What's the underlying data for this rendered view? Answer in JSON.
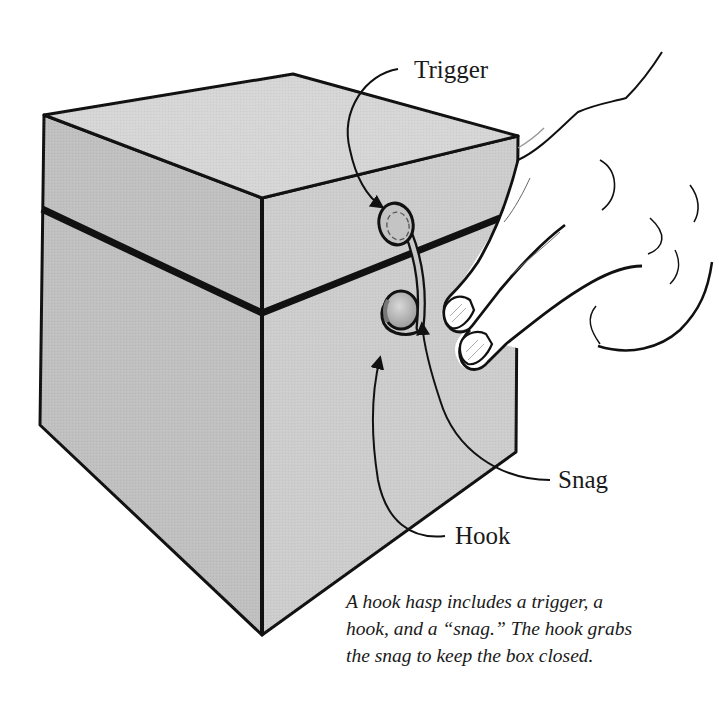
{
  "figure": {
    "colors": {
      "background": "#ffffff",
      "box_top": "#d4d4d4",
      "box_left": "#c0c0c0",
      "box_right": "#cdcdcd",
      "outline": "#111111",
      "hardware": "#b8b8b8",
      "hand": "#ffffff"
    }
  },
  "labels": {
    "trigger": "Trigger",
    "snag": "Snag",
    "hook": "Hook"
  },
  "caption": {
    "lines": [
      "A hook hasp includes a trigger, a",
      "hook, and a “snag.” The hook grabs",
      "the snag to keep the box closed."
    ]
  }
}
